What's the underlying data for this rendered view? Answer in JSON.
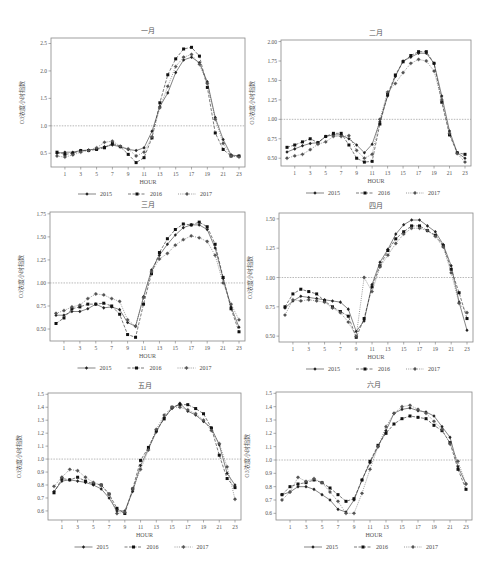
{
  "page": {
    "header_fragment": "",
    "ylabel": "O3浓度小时指数",
    "xlabel": "HOUR",
    "reference_line": 1.0
  },
  "legend": [
    {
      "name": "2015",
      "style": "solid",
      "marker": "diamond"
    },
    {
      "name": "2016",
      "style": "dashed",
      "marker": "square"
    },
    {
      "name": "2017",
      "style": "dotted",
      "marker": "star"
    }
  ],
  "chart_data": [
    {
      "type": "line",
      "title": "一月",
      "xlabel": "HOUR",
      "ylabel": "O3浓度小时指数",
      "x": [
        0,
        1,
        2,
        3,
        4,
        5,
        6,
        7,
        8,
        9,
        10,
        11,
        12,
        13,
        14,
        15,
        16,
        17,
        18,
        19,
        20,
        21,
        22,
        23
      ],
      "xticks": [
        1,
        3,
        5,
        7,
        9,
        11,
        13,
        15,
        17,
        19,
        21,
        23
      ],
      "yticks": [
        0.5,
        1.0,
        1.5,
        2.0,
        2.5
      ],
      "yticklabels": [
        "0.5",
        "1.0",
        "1.5",
        "2.0",
        "2.5"
      ],
      "ylim": [
        0.25,
        2.6
      ],
      "reference_line": 1.0,
      "series": [
        {
          "name": "2015",
          "values": [
            0.5,
            0.52,
            0.52,
            0.55,
            0.56,
            0.58,
            0.62,
            0.65,
            0.62,
            0.57,
            0.55,
            0.6,
            0.9,
            1.35,
            1.6,
            1.97,
            2.2,
            2.25,
            2.15,
            1.8,
            1.15,
            0.75,
            0.47,
            0.45
          ]
        },
        {
          "name": "2016",
          "values": [
            0.52,
            0.48,
            0.5,
            0.55,
            0.55,
            0.57,
            0.6,
            0.68,
            0.62,
            0.48,
            0.33,
            0.42,
            0.78,
            1.42,
            1.93,
            2.22,
            2.4,
            2.43,
            2.27,
            1.7,
            0.87,
            0.57,
            0.45,
            0.45
          ]
        },
        {
          "name": "2017",
          "values": [
            0.45,
            0.43,
            0.47,
            0.52,
            0.55,
            0.6,
            0.7,
            0.72,
            0.63,
            0.58,
            0.45,
            0.52,
            0.8,
            1.33,
            1.72,
            2.08,
            2.25,
            2.3,
            2.12,
            1.77,
            1.12,
            0.68,
            0.45,
            0.43
          ]
        }
      ]
    },
    {
      "type": "line",
      "title": "二月",
      "xlabel": "HOUR",
      "ylabel": "O3浓度小时指数",
      "x": [
        0,
        1,
        2,
        3,
        4,
        5,
        6,
        7,
        8,
        9,
        10,
        11,
        12,
        13,
        14,
        15,
        16,
        17,
        18,
        19,
        20,
        21,
        22,
        23
      ],
      "xticks": [
        1,
        3,
        5,
        7,
        9,
        11,
        13,
        15,
        17,
        19,
        21,
        23
      ],
      "yticks": [
        0.5,
        0.75,
        1.0,
        1.25,
        1.5,
        1.75,
        2.0
      ],
      "yticklabels": [
        "0.50",
        "0.75",
        "1.00",
        "1.25",
        "1.50",
        "1.75",
        "2.00"
      ],
      "ylim": [
        0.4,
        2.02
      ],
      "reference_line": 1.0,
      "series": [
        {
          "name": "2015",
          "values": [
            0.58,
            0.62,
            0.66,
            0.69,
            0.7,
            0.78,
            0.8,
            0.8,
            0.75,
            0.67,
            0.57,
            0.68,
            0.97,
            1.3,
            1.55,
            1.75,
            1.8,
            1.85,
            1.85,
            1.72,
            1.3,
            0.85,
            0.57,
            0.5
          ]
        },
        {
          "name": "2016",
          "values": [
            0.64,
            0.67,
            0.71,
            0.75,
            0.7,
            0.78,
            0.82,
            0.82,
            0.67,
            0.5,
            0.45,
            0.46,
            0.94,
            1.32,
            1.57,
            1.74,
            1.82,
            1.87,
            1.87,
            1.72,
            1.22,
            0.8,
            0.57,
            0.55
          ]
        },
        {
          "name": "2017",
          "values": [
            0.5,
            0.53,
            0.55,
            0.61,
            0.68,
            0.71,
            0.78,
            0.78,
            0.79,
            0.6,
            0.5,
            0.55,
            1.0,
            1.35,
            1.46,
            1.6,
            1.72,
            1.77,
            1.75,
            1.62,
            1.25,
            0.82,
            0.56,
            0.45
          ]
        }
      ]
    },
    {
      "type": "line",
      "title": "三月",
      "xlabel": "HOUR",
      "ylabel": "O3浓度小时指数",
      "x": [
        0,
        1,
        2,
        3,
        4,
        5,
        6,
        7,
        8,
        9,
        10,
        11,
        12,
        13,
        14,
        15,
        16,
        17,
        18,
        19,
        20,
        21,
        22,
        23
      ],
      "xticks": [
        1,
        3,
        5,
        7,
        9,
        11,
        13,
        15,
        17,
        19,
        21,
        23
      ],
      "yticks": [
        0.5,
        0.75,
        1.0,
        1.25,
        1.5,
        1.75
      ],
      "yticklabels": [
        "0.50",
        "0.75",
        "1.00",
        "1.25",
        "1.50",
        "1.75"
      ],
      "ylim": [
        0.37,
        1.77
      ],
      "reference_line": 1.0,
      "series": [
        {
          "name": "2015",
          "values": [
            0.65,
            0.65,
            0.69,
            0.69,
            0.72,
            0.77,
            0.73,
            0.74,
            0.71,
            0.57,
            0.53,
            0.85,
            1.14,
            1.3,
            1.42,
            1.52,
            1.6,
            1.63,
            1.63,
            1.58,
            1.38,
            1.05,
            0.74,
            0.52
          ]
        },
        {
          "name": "2016",
          "values": [
            0.56,
            0.62,
            0.72,
            0.74,
            0.77,
            0.77,
            0.78,
            0.75,
            0.66,
            0.44,
            0.41,
            0.77,
            1.1,
            1.33,
            1.48,
            1.58,
            1.64,
            1.63,
            1.66,
            1.61,
            1.42,
            1.06,
            0.72,
            0.47
          ]
        },
        {
          "name": "2017",
          "values": [
            0.67,
            0.7,
            0.74,
            0.76,
            0.83,
            0.88,
            0.87,
            0.83,
            0.8,
            0.6,
            0.53,
            0.84,
            1.12,
            1.26,
            1.32,
            1.41,
            1.47,
            1.51,
            1.49,
            1.45,
            1.3,
            1.0,
            0.77,
            0.6
          ]
        }
      ]
    },
    {
      "type": "line",
      "title": "四月",
      "xlabel": "HOUR",
      "ylabel": "O3浓度小时指数",
      "x": [
        0,
        1,
        2,
        3,
        4,
        5,
        6,
        7,
        8,
        9,
        10,
        11,
        12,
        13,
        14,
        15,
        16,
        17,
        18,
        19,
        20,
        21,
        22,
        23
      ],
      "xticks": [
        1,
        3,
        5,
        7,
        9,
        11,
        13,
        15,
        17,
        19,
        21,
        23
      ],
      "yticks": [
        0.5,
        0.75,
        1.0,
        1.25,
        1.5
      ],
      "yticklabels": [
        "0.50",
        "0.75",
        "1.00",
        "1.25",
        "1.50"
      ],
      "ylim": [
        0.45,
        1.55
      ],
      "reference_line": 1.0,
      "series": [
        {
          "name": "2015",
          "values": [
            0.74,
            0.8,
            0.84,
            0.83,
            0.82,
            0.81,
            0.8,
            0.79,
            0.73,
            0.54,
            0.63,
            0.94,
            1.13,
            1.24,
            1.37,
            1.45,
            1.49,
            1.49,
            1.44,
            1.39,
            1.28,
            1.1,
            0.79,
            0.55
          ]
        },
        {
          "name": "2016",
          "values": [
            0.75,
            0.86,
            0.9,
            0.88,
            0.86,
            0.8,
            0.75,
            0.71,
            0.67,
            0.49,
            0.65,
            0.92,
            1.1,
            1.23,
            1.33,
            1.39,
            1.44,
            1.44,
            1.4,
            1.36,
            1.27,
            1.07,
            0.87,
            0.65
          ]
        },
        {
          "name": "2017",
          "values": [
            0.68,
            0.81,
            0.8,
            0.81,
            0.8,
            0.79,
            0.74,
            0.7,
            0.62,
            0.5,
            1.0,
            0.88,
            1.09,
            1.19,
            1.29,
            1.37,
            1.42,
            1.42,
            1.4,
            1.35,
            1.26,
            1.04,
            0.78,
            0.7
          ]
        }
      ]
    },
    {
      "type": "line",
      "title": "五月",
      "xlabel": "HOUR",
      "ylabel": "O3浓度小时指数",
      "x": [
        0,
        1,
        2,
        3,
        4,
        5,
        6,
        7,
        8,
        9,
        10,
        11,
        12,
        13,
        14,
        15,
        16,
        17,
        18,
        19,
        20,
        21,
        22,
        23
      ],
      "xticks": [
        1,
        3,
        5,
        7,
        9,
        11,
        13,
        15,
        17,
        19,
        21,
        23
      ],
      "yticks": [
        0.6,
        0.7,
        0.8,
        0.9,
        1.0,
        1.1,
        1.2,
        1.3,
        1.4,
        1.5
      ],
      "yticklabels": [
        "0.6",
        "0.7",
        "0.8",
        "0.9",
        "1.0",
        "1.1",
        "1.2",
        "1.3",
        "1.4",
        "1.5"
      ],
      "ylim": [
        0.53,
        1.51
      ],
      "reference_line": 1.0,
      "series": [
        {
          "name": "2015",
          "values": [
            0.75,
            0.83,
            0.84,
            0.83,
            0.82,
            0.8,
            0.77,
            0.7,
            0.6,
            0.6,
            0.75,
            0.95,
            1.08,
            1.21,
            1.32,
            1.39,
            1.43,
            1.37,
            1.34,
            1.29,
            1.24,
            1.11,
            0.89,
            0.8
          ]
        },
        {
          "name": "2016",
          "values": [
            0.74,
            0.85,
            0.84,
            0.86,
            0.83,
            0.81,
            0.8,
            0.73,
            0.62,
            0.58,
            0.77,
            0.99,
            1.09,
            1.22,
            1.31,
            1.4,
            1.42,
            1.42,
            1.39,
            1.35,
            1.24,
            1.03,
            0.85,
            0.78
          ]
        },
        {
          "name": "2017",
          "values": [
            0.79,
            0.86,
            0.92,
            0.91,
            0.86,
            0.82,
            0.8,
            0.73,
            0.58,
            0.59,
            0.77,
            0.92,
            1.07,
            1.23,
            1.34,
            1.4,
            1.4,
            1.38,
            1.35,
            1.3,
            1.22,
            1.12,
            0.94,
            0.69
          ]
        }
      ]
    },
    {
      "type": "line",
      "title": "六月",
      "xlabel": "HOUR",
      "ylabel": "O3浓度小时指数",
      "x": [
        0,
        1,
        2,
        3,
        4,
        5,
        6,
        7,
        8,
        9,
        10,
        11,
        12,
        13,
        14,
        15,
        16,
        17,
        18,
        19,
        20,
        21,
        22,
        23
      ],
      "xticks": [
        1,
        3,
        5,
        7,
        9,
        11,
        13,
        15,
        17,
        19,
        21,
        23
      ],
      "yticks": [
        0.6,
        0.7,
        0.8,
        0.9,
        1.0,
        1.1,
        1.2,
        1.3,
        1.4,
        1.5
      ],
      "yticklabels": [
        "0.6",
        "0.7",
        "0.8",
        "0.9",
        "1.0",
        "1.1",
        "1.2",
        "1.3",
        "1.4",
        "1.5"
      ],
      "ylim": [
        0.55,
        1.51
      ],
      "reference_line": 1.0,
      "series": [
        {
          "name": "2015",
          "values": [
            0.74,
            0.76,
            0.8,
            0.8,
            0.78,
            0.74,
            0.7,
            0.63,
            0.61,
            0.7,
            0.85,
            0.98,
            1.1,
            1.22,
            1.35,
            1.38,
            1.39,
            1.37,
            1.36,
            1.33,
            1.25,
            1.17,
            0.95,
            0.82
          ]
        },
        {
          "name": "2016",
          "values": [
            0.74,
            0.8,
            0.82,
            0.83,
            0.85,
            0.83,
            0.79,
            0.74,
            0.69,
            0.71,
            0.85,
            0.99,
            1.11,
            1.2,
            1.27,
            1.31,
            1.33,
            1.32,
            1.31,
            1.26,
            1.22,
            1.13,
            0.93,
            0.78
          ]
        },
        {
          "name": "2017",
          "values": [
            0.7,
            0.76,
            0.87,
            0.84,
            0.86,
            0.83,
            0.76,
            0.69,
            0.6,
            0.6,
            0.75,
            0.93,
            1.1,
            1.25,
            1.35,
            1.4,
            1.41,
            1.38,
            1.35,
            1.29,
            1.23,
            1.12,
            0.99,
            0.82
          ]
        }
      ]
    }
  ],
  "layout": [
    {
      "left": 51,
      "top": 38,
      "width": 194,
      "height": 129
    },
    {
      "left": 281,
      "top": 40,
      "width": 190,
      "height": 126
    },
    {
      "left": 50,
      "top": 212,
      "width": 195,
      "height": 129
    },
    {
      "left": 279,
      "top": 213,
      "width": 194,
      "height": 129
    },
    {
      "left": 48,
      "top": 393,
      "width": 193,
      "height": 127
    },
    {
      "left": 276,
      "top": 392,
      "width": 196,
      "height": 128
    }
  ]
}
